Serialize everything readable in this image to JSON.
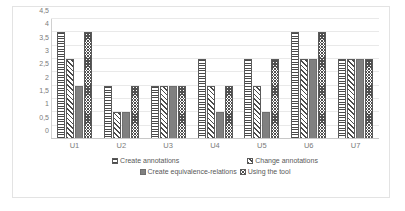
{
  "chart_data": {
    "type": "bar",
    "title": "",
    "xlabel": "",
    "ylabel": "",
    "ylim": [
      0,
      4.5
    ],
    "grid": true,
    "legend_position": "bottom",
    "categories": [
      "U1",
      "U2",
      "U3",
      "U4",
      "U5",
      "U6",
      "U7"
    ],
    "ytick_labels": [
      "0",
      "0,5",
      "1",
      "1,5",
      "2",
      "2,5",
      "3",
      "3,5",
      "4",
      "4,5"
    ],
    "ytick_values": [
      0,
      0.5,
      1,
      1.5,
      2,
      2.5,
      3,
      3.5,
      4,
      4.5
    ],
    "series": [
      {
        "name": "Create annotations",
        "pattern": "horizontal-stripes",
        "color": "#4a4a4a",
        "values": [
          4,
          2,
          2,
          3,
          3,
          4,
          3
        ]
      },
      {
        "name": "Change annotations",
        "pattern": "diagonal-stripes",
        "color": "#4a4a4a",
        "values": [
          3,
          1,
          2,
          2,
          2,
          3,
          3
        ]
      },
      {
        "name": "Create equivalence-relations",
        "pattern": "solid-gray",
        "color": "#808080",
        "values": [
          2,
          1,
          2,
          1,
          1,
          3,
          3
        ]
      },
      {
        "name": "Using the tool",
        "pattern": "checkerboard",
        "color": "#4f4f4f",
        "values": [
          4,
          2,
          2,
          2,
          3,
          4,
          3
        ]
      }
    ]
  },
  "legend": {
    "row1": [
      {
        "label": "Create annotations",
        "icon": "legend-swatch-horizontal-stripes"
      },
      {
        "label": "Change annotations",
        "icon": "legend-swatch-diagonal-stripes"
      }
    ],
    "row2": [
      {
        "label": "Create equivalence-relations",
        "icon": "legend-swatch-solid-gray"
      },
      {
        "label": "Using the tool",
        "icon": "legend-swatch-checkerboard"
      }
    ]
  }
}
